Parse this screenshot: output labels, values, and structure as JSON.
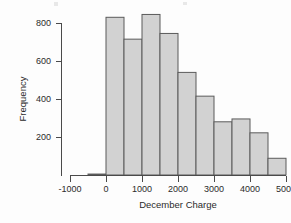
{
  "chart_data": {
    "type": "bar",
    "title": "",
    "subtitle": "",
    "xlabel": "December Charge",
    "ylabel": "Frequency",
    "grid": false,
    "legend": false,
    "legend_position": "none",
    "xlim": [
      -1000,
      5000
    ],
    "ylim": [
      0,
      880
    ],
    "xticks": [
      -1000,
      0,
      1000,
      2000,
      3000,
      4000,
      5000
    ],
    "xtick_labels": [
      "-1000",
      "0",
      "1000",
      "2000",
      "3000",
      "4000",
      "5000"
    ],
    "yticks": [
      200,
      400,
      600,
      800
    ],
    "ytick_labels": [
      "200",
      "400",
      "600",
      "800"
    ],
    "bin_width": 500,
    "bin_edges": [
      -500,
      0,
      500,
      1000,
      1500,
      2000,
      2500,
      3000,
      3500,
      4000,
      4500,
      5000
    ],
    "categories": [
      "-500–0",
      "0–500",
      "500–1000",
      "1000–1500",
      "1500–2000",
      "2000–2500",
      "2500–3000",
      "3000–3500",
      "3500–4000",
      "4000–4500",
      "4500–5000"
    ],
    "values": [
      5,
      830,
      715,
      845,
      745,
      540,
      415,
      280,
      295,
      222,
      88
    ],
    "bar_fill_color": "#d2d2d2",
    "bar_edge_color": "#5b5b5b",
    "axis_color": "#4a4a4a",
    "background_color": "#fdfdfd"
  },
  "axes": {
    "x_title": "December Charge",
    "y_title": "Frequency"
  }
}
